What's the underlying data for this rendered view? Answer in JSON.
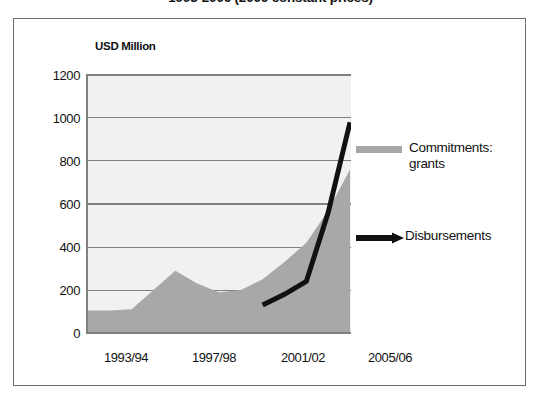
{
  "title": "1993-2006 (2006 constant prices)",
  "unit_label": "USD Million",
  "legend": {
    "area_label": "Commitments: grants",
    "line_label": "Disbursements"
  },
  "colors": {
    "area_fill": "#a8a8a8",
    "line_stroke": "#111111",
    "plot_background": "#f1f1f1",
    "gridline": "#808080",
    "frame_border": "#6e6e6e"
  },
  "chart_data": {
    "type": "area",
    "title": "1993-2006 (2006 constant prices)",
    "xlabel": "",
    "ylabel": "USD Million",
    "ylim": [
      0,
      1200
    ],
    "yticks": [
      0,
      200,
      400,
      600,
      800,
      1000,
      1200
    ],
    "grid": true,
    "legend_position": "right",
    "x": [
      "1993/94",
      "1994/95",
      "1995/96",
      "1996/97",
      "1997/98",
      "1998/99",
      "1999/00",
      "2000/01",
      "2001/02",
      "2002/03",
      "2003/04",
      "2004/05",
      "2005/06"
    ],
    "xtick_labels": [
      "1993/94",
      "1997/98",
      "2001/02",
      "2005/06"
    ],
    "xtick_indices": [
      0,
      4,
      8,
      12
    ],
    "series": [
      {
        "name": "Commitments: grants",
        "type": "area",
        "color": "#a8a8a8",
        "values": [
          105,
          105,
          110,
          200,
          290,
          230,
          190,
          200,
          250,
          330,
          420,
          570,
          760
        ]
      },
      {
        "name": "Disbursements",
        "type": "line",
        "color": "#111111",
        "values": [
          null,
          null,
          null,
          null,
          null,
          null,
          null,
          null,
          130,
          180,
          240,
          560,
          980
        ]
      }
    ]
  }
}
